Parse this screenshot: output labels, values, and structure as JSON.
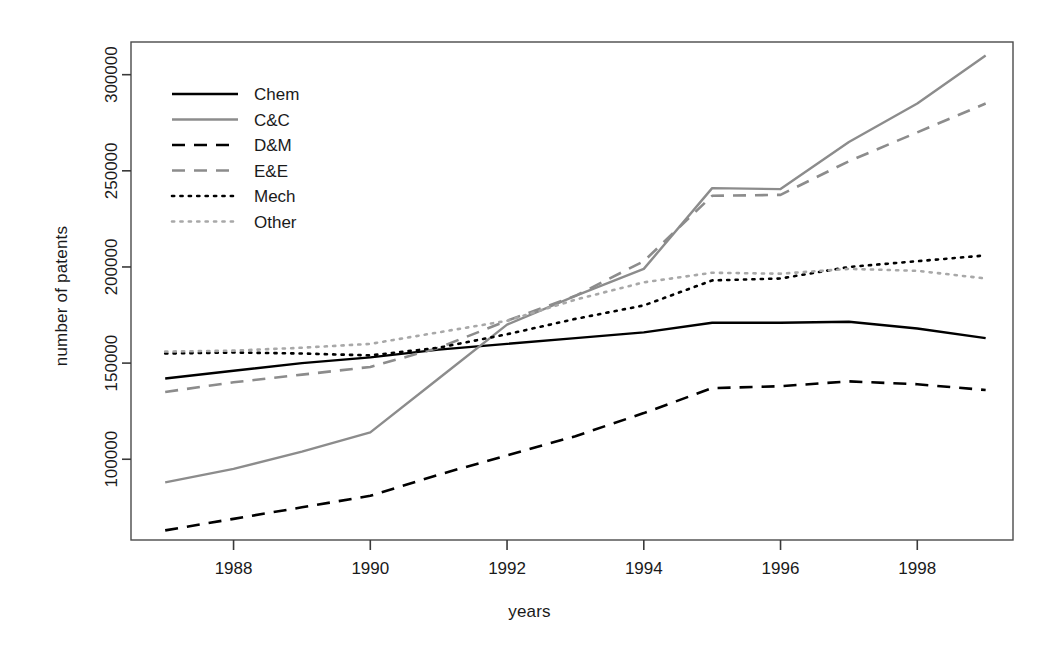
{
  "chart_data": {
    "type": "line",
    "title": "",
    "xlabel": "years",
    "ylabel": "number of patents",
    "x": [
      1987,
      1988,
      1989,
      1990,
      1991,
      1992,
      1993,
      1994,
      1995,
      1996,
      1997,
      1998,
      1999
    ],
    "xlim": [
      1986.5,
      1999.4
    ],
    "ylim": [
      58000,
      317000
    ],
    "xticks": [
      1988,
      1990,
      1992,
      1994,
      1996,
      1998
    ],
    "xticklabels": [
      "1988",
      "1990",
      "1992",
      "1994",
      "1996",
      "1998"
    ],
    "yticks": [
      100000,
      150000,
      200000,
      250000,
      300000
    ],
    "yticklabels": [
      "100000",
      "150000",
      "200000",
      "250000",
      "300000"
    ],
    "grid": false,
    "legend_position": "top-left",
    "series": [
      {
        "name": "Chem",
        "color": "#000000",
        "style": "solid",
        "values": [
          142000,
          146000,
          150000,
          153000,
          157000,
          160000,
          163000,
          166000,
          171000,
          171000,
          171500,
          168000,
          163000
        ]
      },
      {
        "name": "C&C",
        "color": "#8c8c8c",
        "style": "solid",
        "values": [
          88000,
          95000,
          104000,
          114000,
          142000,
          170000,
          185000,
          199000,
          241000,
          240500,
          265000,
          285000,
          310000
        ]
      },
      {
        "name": "D&M",
        "color": "#000000",
        "style": "dashed",
        "values": [
          63000,
          69000,
          75000,
          81000,
          92000,
          102000,
          112000,
          124000,
          137000,
          138000,
          140500,
          139000,
          136000
        ]
      },
      {
        "name": "E&E",
        "color": "#8c8c8c",
        "style": "dashed",
        "values": [
          135000,
          140000,
          144000,
          148000,
          158000,
          172000,
          185000,
          203000,
          237000,
          237500,
          255000,
          270000,
          285000
        ]
      },
      {
        "name": "Mech",
        "color": "#000000",
        "style": "dotted",
        "values": [
          155000,
          155500,
          155000,
          154000,
          158000,
          165000,
          173000,
          180000,
          193000,
          194000,
          200000,
          203000,
          206000
        ]
      },
      {
        "name": "Other",
        "color": "#a8a8a8",
        "style": "dotted",
        "values": [
          156000,
          156500,
          158000,
          160000,
          166000,
          172000,
          183000,
          192000,
          197000,
          196500,
          199000,
          198000,
          194000
        ]
      }
    ]
  }
}
